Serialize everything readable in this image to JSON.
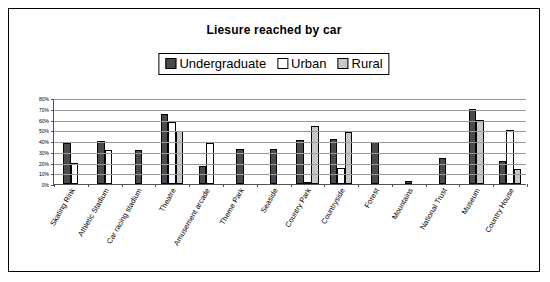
{
  "chart_data": {
    "type": "bar",
    "title": "Liesure reached by car",
    "xlabel": "",
    "ylabel": "",
    "ylim": [
      0,
      80
    ],
    "ytick_labels": [
      "0%",
      "10%",
      "20%",
      "30%",
      "40%",
      "50%",
      "60%",
      "70%",
      "80%"
    ],
    "ytick_values": [
      0,
      10,
      20,
      30,
      40,
      50,
      60,
      70,
      80
    ],
    "grid": true,
    "legend_position": "top-center",
    "categories": [
      "Skating Rink",
      "Athletic Stadium",
      "Car racing stadium",
      "Theatre",
      "Amusement arcade",
      "Theme Park",
      "Seaside",
      "Country Park",
      "Countryside",
      "Forest",
      "Mountains",
      "National Trust",
      "Museum",
      "Country House"
    ],
    "series": [
      {
        "name": "Undergraduate",
        "color": "#4a4a4a",
        "values": [
          38,
          40,
          32,
          65,
          17,
          33,
          33,
          41,
          42,
          39,
          3,
          24,
          70,
          21
        ]
      },
      {
        "name": "Urban",
        "color": "#ffffff",
        "values": [
          20,
          32,
          0,
          58,
          38,
          0,
          0,
          2,
          15,
          0,
          0,
          0,
          0,
          50
        ]
      },
      {
        "name": "Rural",
        "color": "#c8c8c8",
        "values": [
          0,
          0,
          0,
          49,
          0,
          0,
          0,
          54,
          48,
          0,
          0,
          0,
          60,
          14
        ]
      }
    ]
  },
  "legend": {
    "items": [
      {
        "label": "Undergraduate",
        "swatch": "dark-swatch"
      },
      {
        "label": "Urban",
        "swatch": "white-swatch"
      },
      {
        "label": "Rural",
        "swatch": "gray-swatch"
      }
    ]
  }
}
